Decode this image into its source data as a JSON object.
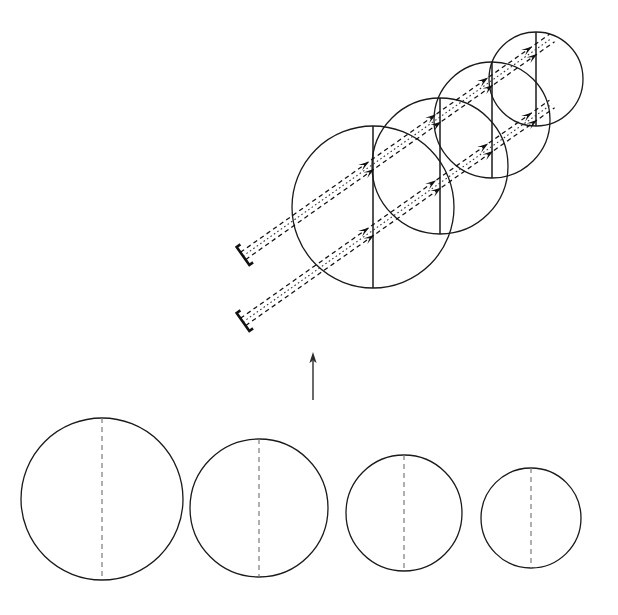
{
  "figure": {
    "background_color": "#ffffff",
    "width": 618,
    "height": 615,
    "stroke_color": "#1a1a1a",
    "dashed_color": "#7a7a7a",
    "ray_color": "#111111"
  },
  "chart_data": {
    "type": "diagram",
    "xlabel": "",
    "ylabel": "",
    "upper_group": {
      "label": "perspective stack of four overlapping spheres with ray bundles",
      "circle_count": 4,
      "circles": [
        {
          "index": 1,
          "cx": 373,
          "cy": 207,
          "r": 81,
          "chord_x": 373,
          "chord_style": "solid",
          "order": "front"
        },
        {
          "index": 2,
          "cx": 440,
          "cy": 166,
          "r": 68,
          "chord_x": 440,
          "chord_style": "solid",
          "order": "second"
        },
        {
          "index": 3,
          "cx": 492,
          "cy": 120,
          "r": 58,
          "chord_x": 492,
          "chord_style": "solid",
          "order": "third"
        },
        {
          "index": 4,
          "cx": 536,
          "cy": 79,
          "r": 47,
          "chord_x": 536,
          "chord_style": "solid",
          "order": "back"
        }
      ],
      "ray_bundles": [
        {
          "index": 1,
          "name": "upper-ray-bundle",
          "tail_x": 243,
          "tail_y": 256,
          "head_x": 552,
          "head_y": 38,
          "angle_deg": -35,
          "dashed_segments": 2,
          "dotted_segments": 1,
          "arrowhead_count": 8
        },
        {
          "index": 2,
          "name": "lower-ray-bundle",
          "tail_x": 243,
          "tail_y": 322,
          "head_x": 552,
          "head_y": 104,
          "angle_deg": -35,
          "dashed_segments": 2,
          "dotted_segments": 1,
          "arrowhead_count": 8
        }
      ],
      "tail_marker": "open-bracket"
    },
    "connector_arrow": {
      "name": "upward-connector-arrow",
      "x": 313,
      "y_start": 400,
      "y_end": 352,
      "direction": "up",
      "style": "solid"
    },
    "lower_group": {
      "label": "four spheres of decreasing radius shown in a row, each with a dashed vertical diameter",
      "circle_count": 4,
      "circles": [
        {
          "index": 1,
          "cx": 102,
          "cy": 499,
          "r": 81,
          "chord_x": 102,
          "chord_style": "dashed"
        },
        {
          "index": 2,
          "cx": 259,
          "cy": 508,
          "r": 69,
          "chord_x": 259,
          "chord_style": "dashed"
        },
        {
          "index": 3,
          "cx": 404,
          "cy": 513,
          "r": 58,
          "chord_x": 404,
          "chord_style": "dashed"
        },
        {
          "index": 4,
          "cx": 531,
          "cy": 518,
          "r": 50,
          "chord_x": 531,
          "chord_style": "dashed"
        }
      ]
    }
  }
}
